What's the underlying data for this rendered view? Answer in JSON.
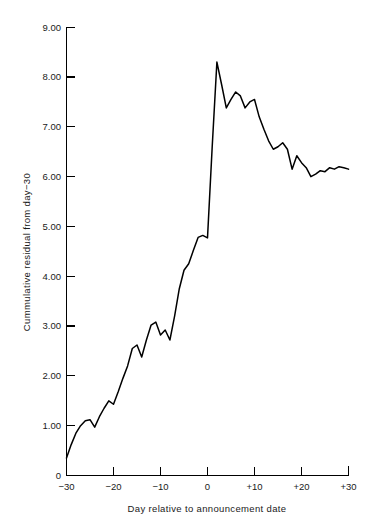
{
  "chart_data": {
    "type": "line",
    "title": "",
    "subtitle": "",
    "xlabel": "Day relative to announcement date",
    "ylabel": "Cummulative residual from day−30",
    "xlim": [
      -30,
      30
    ],
    "ylim": [
      0,
      9
    ],
    "grid": false,
    "legend": false,
    "legend_position": "none",
    "line_color": "#000000",
    "xticks": [
      -30,
      -20,
      -10,
      0,
      10,
      20,
      30
    ],
    "xtick_labels": [
      "−30",
      "−20",
      "−10",
      "0",
      "+10",
      "+20",
      "+30"
    ],
    "yticks": [
      0,
      1,
      2,
      3,
      4,
      5,
      6,
      7,
      8,
      9
    ],
    "ytick_labels": [
      "0",
      "1.00",
      "2.00",
      "3.00",
      "4.00",
      "5.00",
      "6.00",
      "7.00",
      "8.00",
      "9.00"
    ],
    "series": [
      {
        "name": "Cumulative residual",
        "x": [
          -30,
          -29,
          -28,
          -27,
          -26,
          -25,
          -24,
          -23,
          -22,
          -21,
          -20,
          -19,
          -18,
          -17,
          -16,
          -15,
          -14,
          -13,
          -12,
          -11,
          -10,
          -9,
          -8,
          -7,
          -6,
          -5,
          -4,
          -3,
          -2,
          -1,
          0,
          1,
          2,
          3,
          4,
          5,
          6,
          7,
          8,
          9,
          10,
          11,
          12,
          13,
          14,
          15,
          16,
          17,
          18,
          19,
          20,
          21,
          22,
          23,
          24,
          25,
          26,
          27,
          28,
          29,
          30
        ],
        "y": [
          0.35,
          0.62,
          0.85,
          1.0,
          1.1,
          1.12,
          0.97,
          1.18,
          1.35,
          1.5,
          1.43,
          1.68,
          1.95,
          2.2,
          2.55,
          2.62,
          2.38,
          2.72,
          3.02,
          3.08,
          2.82,
          2.92,
          2.72,
          3.2,
          3.75,
          4.12,
          4.25,
          4.52,
          4.78,
          4.82,
          4.77,
          6.6,
          8.3,
          7.85,
          7.38,
          7.55,
          7.7,
          7.62,
          7.38,
          7.5,
          7.55,
          7.2,
          6.95,
          6.72,
          6.55,
          6.6,
          6.68,
          6.55,
          6.15,
          6.42,
          6.28,
          6.18,
          6.0,
          6.05,
          6.12,
          6.1,
          6.18,
          6.15,
          6.2,
          6.18,
          6.15
        ]
      }
    ]
  },
  "axes": {
    "y_tick_values": [
      "9.00",
      "8.00",
      "7.00",
      "6.00",
      "5.00",
      "4.00",
      "3.00",
      "2.00",
      "1.00",
      "0"
    ],
    "x_tick_values": [
      "−30",
      "−20",
      "−10",
      "0",
      "+10",
      "+20",
      "+30"
    ],
    "x_title": "Day relative to announcement date",
    "y_title": "Cummulative residual from day−30"
  }
}
